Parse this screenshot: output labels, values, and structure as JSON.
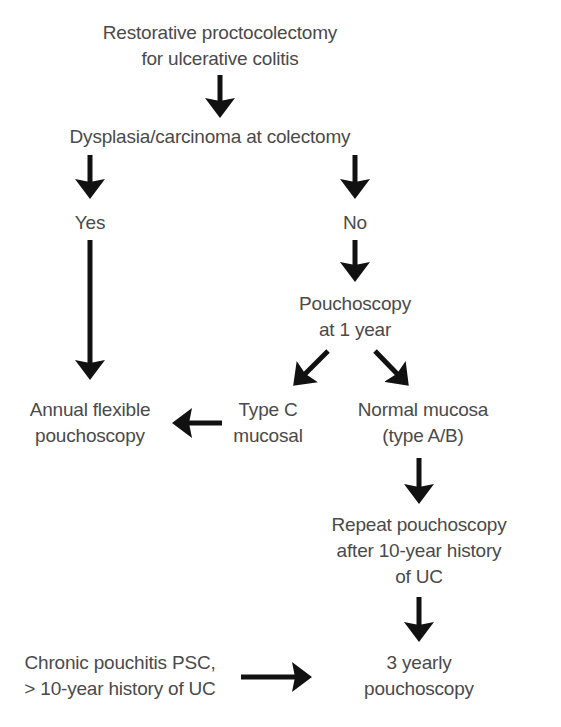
{
  "diagram": {
    "type": "flowchart",
    "text_color": "#4a4a4a",
    "arrow_color": "#111111",
    "nodes": {
      "start": {
        "lines": [
          "Restorative proctocolectomy",
          "for ulcerative colitis"
        ]
      },
      "dysplasia": {
        "lines": [
          "Dysplasia/carcinoma at colectomy"
        ]
      },
      "yes": {
        "lines": [
          "Yes"
        ]
      },
      "no": {
        "lines": [
          "No"
        ]
      },
      "pouchoscopy_1yr": {
        "lines": [
          "Pouchoscopy",
          "at 1 year"
        ]
      },
      "annual": {
        "lines": [
          "Annual flexible",
          "pouchoscopy"
        ]
      },
      "type_c": {
        "lines": [
          "Type C",
          "mucosal"
        ]
      },
      "normal": {
        "lines": [
          "Normal mucosa",
          "(type A/B)"
        ]
      },
      "repeat": {
        "lines": [
          "Repeat pouchoscopy",
          "after 10-year history",
          "of UC"
        ]
      },
      "chronic": {
        "lines": [
          "Chronic pouchitis PSC,",
          "> 10-year history of UC"
        ]
      },
      "three_yearly": {
        "lines": [
          "3 yearly",
          "pouchoscopy"
        ]
      }
    },
    "edges": [
      {
        "from": "start",
        "to": "dysplasia"
      },
      {
        "from": "dysplasia",
        "to": "yes"
      },
      {
        "from": "dysplasia",
        "to": "no"
      },
      {
        "from": "yes",
        "to": "annual"
      },
      {
        "from": "no",
        "to": "pouchoscopy_1yr"
      },
      {
        "from": "pouchoscopy_1yr",
        "to": "type_c"
      },
      {
        "from": "pouchoscopy_1yr",
        "to": "normal"
      },
      {
        "from": "type_c",
        "to": "annual"
      },
      {
        "from": "normal",
        "to": "repeat"
      },
      {
        "from": "repeat",
        "to": "three_yearly"
      },
      {
        "from": "chronic",
        "to": "three_yearly"
      }
    ]
  }
}
